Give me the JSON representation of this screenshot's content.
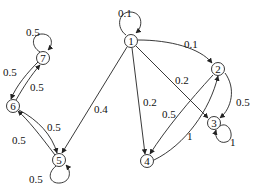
{
  "diagram": {
    "type": "markov-chain-state-graph",
    "nodes": [
      {
        "id": "1",
        "label": "1",
        "x": 131,
        "y": 41
      },
      {
        "id": "2",
        "label": "2",
        "x": 218,
        "y": 69
      },
      {
        "id": "3",
        "label": "3",
        "x": 214,
        "y": 123
      },
      {
        "id": "4",
        "label": "4",
        "x": 147,
        "y": 161
      },
      {
        "id": "5",
        "label": "5",
        "x": 59,
        "y": 160
      },
      {
        "id": "6",
        "label": "6",
        "x": 13,
        "y": 106
      },
      {
        "id": "7",
        "label": "7",
        "x": 43,
        "y": 58
      }
    ],
    "edges": [
      {
        "from": "1",
        "to": "1",
        "weight": "0.1"
      },
      {
        "from": "1",
        "to": "2",
        "weight": "0.1"
      },
      {
        "from": "1",
        "to": "3",
        "weight": "0.2"
      },
      {
        "from": "1",
        "to": "4",
        "weight": "0.2"
      },
      {
        "from": "1",
        "to": "5",
        "weight": "0.4"
      },
      {
        "from": "2",
        "to": "3",
        "weight": "0.5"
      },
      {
        "from": "2",
        "to": "4",
        "weight": "0.5"
      },
      {
        "from": "3",
        "to": "3",
        "weight": "1"
      },
      {
        "from": "4",
        "to": "2",
        "weight": "1"
      },
      {
        "from": "5",
        "to": "5",
        "weight": "0.5"
      },
      {
        "from": "5",
        "to": "6",
        "weight": "0.5"
      },
      {
        "from": "6",
        "to": "5",
        "weight": "0.5"
      },
      {
        "from": "6",
        "to": "7",
        "weight": "0.5"
      },
      {
        "from": "7",
        "to": "6",
        "weight": "0.5"
      },
      {
        "from": "7",
        "to": "7",
        "weight": "0.5"
      }
    ]
  }
}
